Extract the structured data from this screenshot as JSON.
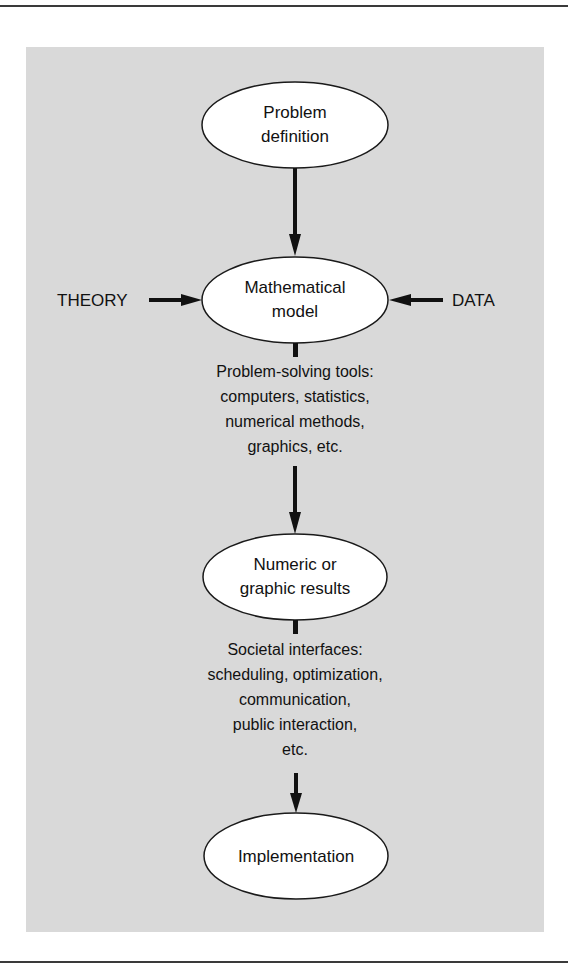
{
  "diagram": {
    "type": "flowchart",
    "colors": {
      "panel_background": "#d9d9d9",
      "node_fill": "#ffffff",
      "stroke": "#111111"
    },
    "nodes": [
      {
        "id": "problem",
        "lines": [
          "Problem",
          "definition"
        ]
      },
      {
        "id": "model",
        "lines": [
          "Mathematical",
          "model"
        ]
      },
      {
        "id": "results",
        "lines": [
          "Numeric or",
          "graphic results"
        ]
      },
      {
        "id": "implementation",
        "lines": [
          "Implementation"
        ]
      }
    ],
    "inputs": {
      "left": "THEORY",
      "right": "DATA"
    },
    "edge_labels": {
      "tools": [
        "Problem-solving tools:",
        "computers, statistics,",
        "numerical methods,",
        "graphics, etc."
      ],
      "societal": [
        "Societal interfaces:",
        "scheduling, optimization,",
        "communication,",
        "public interaction,",
        "etc."
      ]
    },
    "edges": [
      {
        "from": "problem",
        "to": "model"
      },
      {
        "from": "THEORY",
        "to": "model"
      },
      {
        "from": "DATA",
        "to": "model"
      },
      {
        "from": "model",
        "to": "results",
        "label": "tools"
      },
      {
        "from": "results",
        "to": "implementation",
        "label": "societal"
      }
    ]
  }
}
